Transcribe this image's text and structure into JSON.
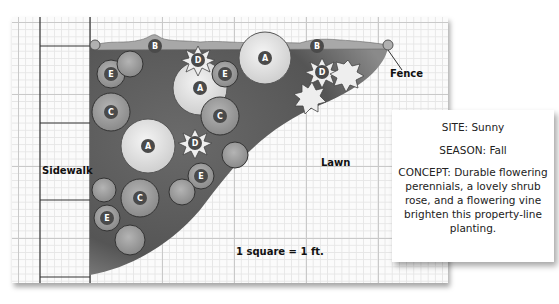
{
  "labels": {
    "fence": "Fence",
    "sidewalk": "Sidewalk",
    "lawn": "Lawn",
    "scale": "1 square = 1 ft."
  },
  "info_box": {
    "site": "SITE: Sunny",
    "season": "SEASON: Fall",
    "concept": "CONCEPT: Durable flowering perennials, a lovely shrub rose, and a flowering vine brighten this property-line planting."
  },
  "plants": [
    {
      "key": "A",
      "cx": 200,
      "cy": 88
    },
    {
      "key": "A",
      "cx": 265,
      "cy": 58
    },
    {
      "key": "A",
      "cx": 148,
      "cy": 146
    },
    {
      "key": "B",
      "cx": 155,
      "cy": 46
    },
    {
      "key": "B",
      "cx": 317,
      "cy": 46
    },
    {
      "key": "C",
      "cx": 111,
      "cy": 112
    },
    {
      "key": "C",
      "cx": 220,
      "cy": 116
    },
    {
      "key": "C",
      "cx": 140,
      "cy": 198
    },
    {
      "key": "D",
      "cx": 198,
      "cy": 60
    },
    {
      "key": "D",
      "cx": 322,
      "cy": 72
    },
    {
      "key": "D",
      "cx": 195,
      "cy": 143
    },
    {
      "key": "E",
      "cx": 111,
      "cy": 74
    },
    {
      "key": "E",
      "cx": 225,
      "cy": 74
    },
    {
      "key": "E",
      "cx": 201,
      "cy": 176
    },
    {
      "key": "E",
      "cx": 107,
      "cy": 218
    }
  ],
  "colors": {
    "bed": "#5c5c5c",
    "plant_light": "#e4e4e4",
    "plant_mid": "#9a9a9a",
    "badge": "#4a4a4a",
    "fence": "#a8a8a8"
  }
}
